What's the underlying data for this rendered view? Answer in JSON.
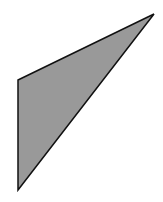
{
  "figure": {
    "shape": "triangle",
    "fill": "#999999",
    "stroke": "#111111",
    "stroke_width": 1.5,
    "points": "18,80 154,14 18,190"
  }
}
